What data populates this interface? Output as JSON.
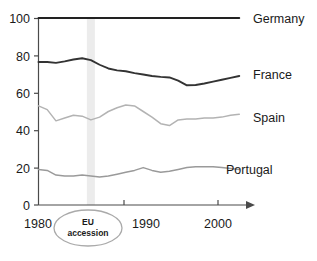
{
  "chart_data": {
    "type": "line",
    "title": "",
    "subtitle": "",
    "xlabel": "",
    "ylabel": "",
    "xlim": [
      1980,
      2004
    ],
    "ylim": [
      0,
      100
    ],
    "grid": false,
    "legend_position": "right-of-line-ends",
    "x_ticks": [
      "1980",
      "1990",
      "2000"
    ],
    "x_tick_values": [
      1980,
      1990,
      2000
    ],
    "y_ticks": [
      "0",
      "20",
      "40",
      "60",
      "80",
      "100"
    ],
    "y_tick_values": [
      0,
      20,
      40,
      60,
      80,
      100
    ],
    "x": [
      1980,
      1981,
      1982,
      1983,
      1984,
      1985,
      1986,
      1987,
      1988,
      1989,
      1990,
      1991,
      1992,
      1993,
      1994,
      1995,
      1996,
      1997,
      1998,
      1999,
      2000,
      2001,
      2002,
      2003
    ],
    "series": [
      {
        "name": "Germany",
        "color": "#222222",
        "values": [
          100,
          100,
          100,
          100,
          100,
          100,
          100,
          100,
          100,
          100,
          100,
          100,
          100,
          100,
          100,
          100,
          100,
          100,
          100,
          100,
          100,
          100,
          100,
          100
        ]
      },
      {
        "name": "France",
        "color": "#333333",
        "values": [
          76.5,
          76.5,
          76.0,
          76.8,
          77.8,
          78.5,
          77.5,
          75.0,
          73.0,
          72.0,
          71.5,
          70.5,
          69.8,
          69.0,
          68.5,
          68.2,
          66.5,
          64.0,
          64.2,
          65.0,
          66.0,
          67.0,
          68.0,
          69.0
        ]
      },
      {
        "name": "Spain",
        "color": "#b3b3b3",
        "values": [
          53.0,
          51.0,
          45.0,
          46.5,
          48.0,
          47.5,
          45.5,
          47.0,
          50.0,
          52.0,
          53.5,
          53.0,
          50.0,
          47.0,
          43.5,
          42.5,
          45.5,
          46.0,
          46.0,
          46.5,
          46.5,
          47.0,
          48.0,
          48.5
        ]
      },
      {
        "name": "Portugal",
        "color": "#9a9a9a",
        "values": [
          19.0,
          18.5,
          16.0,
          15.5,
          15.5,
          16.0,
          15.5,
          15.0,
          15.5,
          16.5,
          17.5,
          18.5,
          20.0,
          18.5,
          17.5,
          18.0,
          19.0,
          20.0,
          20.5,
          20.5,
          20.5,
          20.0,
          19.5,
          19.0
        ]
      }
    ],
    "annotations": [
      {
        "name": "eu-accession",
        "line1": "EU",
        "line2": "accession",
        "x_value": 1986,
        "band_color": "#ececec",
        "oval_color": "#aaaaaa"
      }
    ]
  },
  "axis": {
    "y_labels": [
      "100",
      "80",
      "60",
      "40",
      "20",
      "0"
    ],
    "x_labels": [
      "1980",
      "1990",
      "2000"
    ]
  },
  "series_labels": {
    "germany": "Germany",
    "france": "France",
    "spain": "Spain",
    "portugal": "Portugal"
  },
  "annotation": {
    "eu_line1": "EU",
    "eu_line2": "accession"
  },
  "colors": {
    "axis": "#4a4a4a",
    "germany": "#222222",
    "france": "#333333",
    "spain": "#b3b3b3",
    "portugal": "#9a9a9a",
    "band": "#ececec",
    "oval": "#aaaaaa",
    "text": "#1a1a1a",
    "background": "#ffffff"
  }
}
